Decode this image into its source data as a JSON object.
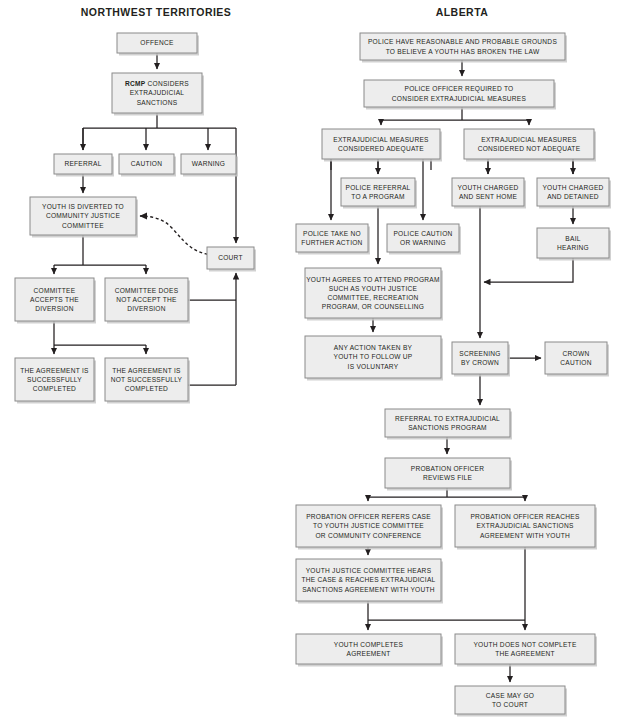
{
  "diagram": {
    "title_left": "NORTHWEST TERRITORIES",
    "title_right": "ALBERTA",
    "box_fill": "#ededed",
    "box_stroke": "#8a8a8a",
    "line_color": "#231f20",
    "background": "#ffffff"
  },
  "columns": [
    {
      "id": "nwt",
      "label": "NORTHWEST TERRITORIES",
      "x": 156,
      "y": 16
    },
    {
      "id": "alberta",
      "label": "ALBERTA",
      "x": 462,
      "y": 16
    }
  ],
  "nodes": [
    {
      "id": "nwt_offence",
      "column": "nwt",
      "x": 117,
      "y": 33,
      "w": 80,
      "h": 20,
      "lines": [
        "OFFENCE"
      ]
    },
    {
      "id": "nwt_rcmp",
      "column": "nwt",
      "x": 112,
      "y": 73,
      "w": 90,
      "h": 40,
      "lines": [
        "RCMP CONSIDERS",
        "EXTRAJUDICIAL",
        "SANCTIONS"
      ],
      "bold_prefix": "RCMP"
    },
    {
      "id": "nwt_referral",
      "column": "nwt",
      "x": 54,
      "y": 154,
      "w": 58,
      "h": 20,
      "lines": [
        "REFERRAL"
      ]
    },
    {
      "id": "nwt_caution",
      "column": "nwt",
      "x": 119,
      "y": 154,
      "w": 55,
      "h": 20,
      "lines": [
        "CAUTION"
      ]
    },
    {
      "id": "nwt_warning",
      "column": "nwt",
      "x": 181,
      "y": 154,
      "w": 55,
      "h": 20,
      "lines": [
        "WARNING"
      ]
    },
    {
      "id": "nwt_diverted",
      "column": "nwt",
      "x": 30,
      "y": 197,
      "w": 106,
      "h": 38,
      "lines": [
        "YOUTH IS DIVERTED TO",
        "COMMUNITY JUSTICE",
        "COMMITTEE"
      ]
    },
    {
      "id": "nwt_court",
      "column": "nwt",
      "x": 207,
      "y": 247,
      "w": 47,
      "h": 22,
      "lines": [
        "COURT"
      ]
    },
    {
      "id": "nwt_accepts",
      "column": "nwt",
      "x": 15,
      "y": 278,
      "w": 79,
      "h": 43,
      "lines": [
        "COMMITTEE",
        "ACCEPTS THE",
        "DIVERSION"
      ]
    },
    {
      "id": "nwt_not_accepts",
      "column": "nwt",
      "x": 105,
      "y": 278,
      "w": 83,
      "h": 43,
      "lines": [
        "COMMITTEE DOES",
        "NOT ACCEPT THE",
        "DIVERSION"
      ]
    },
    {
      "id": "nwt_success",
      "column": "nwt",
      "x": 15,
      "y": 358,
      "w": 79,
      "h": 43,
      "lines": [
        "THE AGREEMENT IS",
        "SUCCESSFULLY",
        "COMPLETED"
      ]
    },
    {
      "id": "nwt_not_success",
      "column": "nwt",
      "x": 105,
      "y": 358,
      "w": 83,
      "h": 43,
      "lines": [
        "THE AGREEMENT IS",
        "NOT SUCCESSFULLY",
        "COMPLETED"
      ]
    },
    {
      "id": "ab_grounds",
      "column": "alberta",
      "x": 360,
      "y": 33,
      "w": 205,
      "h": 27,
      "lines": [
        "POLICE HAVE REASONABLE AND PROBABLE GROUNDS",
        "TO BELIEVE A YOUTH HAS BROKEN THE LAW"
      ]
    },
    {
      "id": "ab_consider",
      "column": "alberta",
      "x": 364,
      "y": 80,
      "w": 190,
      "h": 27,
      "lines": [
        "POLICE OFFICER REQUIRED TO",
        "CONSIDER EXTRAJUDICIAL MEASURES"
      ]
    },
    {
      "id": "ab_adequate",
      "column": "alberta",
      "x": 322,
      "y": 129,
      "w": 118,
      "h": 30,
      "lines": [
        "EXTRAJUDICIAL MEASURES",
        "CONSIDERED ADEQUATE"
      ]
    },
    {
      "id": "ab_not_adequate",
      "column": "alberta",
      "x": 464,
      "y": 129,
      "w": 130,
      "h": 30,
      "lines": [
        "EXTRAJUDICIAL MEASURES",
        "CONSIDERED NOT ADEQUATE"
      ]
    },
    {
      "id": "ab_referral_prog",
      "column": "alberta",
      "x": 341,
      "y": 178,
      "w": 74,
      "h": 28,
      "lines": [
        "POLICE REFERRAL",
        "TO A PROGRAM"
      ]
    },
    {
      "id": "ab_sent_home",
      "column": "alberta",
      "x": 452,
      "y": 178,
      "w": 72,
      "h": 28,
      "lines": [
        "YOUTH CHARGED",
        "AND SENT HOME"
      ]
    },
    {
      "id": "ab_detained",
      "column": "alberta",
      "x": 537,
      "y": 178,
      "w": 72,
      "h": 28,
      "lines": [
        "YOUTH CHARGED",
        "AND DETAINED"
      ]
    },
    {
      "id": "ab_no_action",
      "column": "alberta",
      "x": 296,
      "y": 224,
      "w": 72,
      "h": 28,
      "lines": [
        "POLICE TAKE NO",
        "FURTHER ACTION"
      ]
    },
    {
      "id": "ab_caution_warning",
      "column": "alberta",
      "x": 387,
      "y": 224,
      "w": 72,
      "h": 28,
      "lines": [
        "POLICE CAUTION",
        "OR WARNING"
      ]
    },
    {
      "id": "ab_bail",
      "column": "alberta",
      "x": 537,
      "y": 228,
      "w": 72,
      "h": 30,
      "lines": [
        "BAIL",
        "HEARING"
      ]
    },
    {
      "id": "ab_agrees",
      "column": "alberta",
      "x": 305,
      "y": 268,
      "w": 136,
      "h": 50,
      "lines": [
        "YOUTH AGREES TO ATTEND PROGRAM",
        "SUCH AS YOUTH JUSTICE",
        "COMMITTEE, RECREATION",
        "PROGRAM, OR COUNSELLING"
      ]
    },
    {
      "id": "ab_voluntary",
      "column": "alberta",
      "x": 305,
      "y": 336,
      "w": 136,
      "h": 42,
      "lines": [
        "ANY ACTION TAKEN BY",
        "YOUTH TO FOLLOW UP",
        "IS VOLUNTARY"
      ]
    },
    {
      "id": "ab_screening",
      "column": "alberta",
      "x": 452,
      "y": 342,
      "w": 56,
      "h": 32,
      "lines": [
        "SCREENING",
        "BY CROWN"
      ]
    },
    {
      "id": "ab_crown_caution",
      "column": "alberta",
      "x": 545,
      "y": 342,
      "w": 62,
      "h": 32,
      "lines": [
        "CROWN",
        "CAUTION"
      ]
    },
    {
      "id": "ab_refer_sanctions",
      "column": "alberta",
      "x": 385,
      "y": 409,
      "w": 125,
      "h": 28,
      "lines": [
        "REFERRAL TO EXTRAJUDICIAL",
        "SANCTIONS PROGRAM"
      ]
    },
    {
      "id": "ab_probation_rev",
      "column": "alberta",
      "x": 385,
      "y": 458,
      "w": 125,
      "h": 30,
      "lines": [
        "PROBATION OFFICER",
        "REVIEWS FILE"
      ]
    },
    {
      "id": "ab_po_refers",
      "column": "alberta",
      "x": 296,
      "y": 505,
      "w": 145,
      "h": 42,
      "lines": [
        "PROBATION OFFICER REFERS CASE",
        "TO YOUTH JUSTICE COMMITTEE",
        "OR COMMUNITY CONFERENCE"
      ]
    },
    {
      "id": "ab_po_reaches",
      "column": "alberta",
      "x": 455,
      "y": 505,
      "w": 140,
      "h": 42,
      "lines": [
        "PROBATION OFFICER REACHES",
        "EXTRAJUDICIAL SANCTIONS",
        "AGREEMENT WITH YOUTH"
      ]
    },
    {
      "id": "ab_yjc_hears",
      "column": "alberta",
      "x": 296,
      "y": 559,
      "w": 145,
      "h": 42,
      "lines": [
        "YOUTH JUSTICE COMMITTEE HEARS",
        "THE CASE & REACHES EXTRAJUDICIAL",
        "SANCTIONS AGREEMENT WITH YOUTH"
      ]
    },
    {
      "id": "ab_completes",
      "column": "alberta",
      "x": 296,
      "y": 634,
      "w": 145,
      "h": 30,
      "lines": [
        "YOUTH COMPLETES",
        "AGREEMENT"
      ]
    },
    {
      "id": "ab_not_completes",
      "column": "alberta",
      "x": 455,
      "y": 634,
      "w": 140,
      "h": 30,
      "lines": [
        "YOUTH DOES NOT COMPLETE",
        "THE AGREEMENT"
      ]
    },
    {
      "id": "ab_may_go_court",
      "column": "alberta",
      "x": 455,
      "y": 686,
      "w": 110,
      "h": 28,
      "lines": [
        "CASE MAY GO",
        "TO COURT"
      ]
    }
  ],
  "edges": [
    {
      "id": "e_offence_rcmp",
      "d": "M157,53 L157,69",
      "arrow": true
    },
    {
      "id": "e_rcmp_split",
      "d": "M157,113 L157,128 M83,128 L236,128 M83,128 L83,150",
      "arrow": false
    },
    {
      "id": "e_to_referral",
      "d": "M83,128 L83,150",
      "arrow": true
    },
    {
      "id": "e_to_caution",
      "d": "M146,128 L146,150",
      "arrow": true
    },
    {
      "id": "e_to_warning",
      "d": "M208,128 L208,150",
      "arrow": true
    },
    {
      "id": "e_to_court_top",
      "d": "M236,128 L236,243",
      "arrow": true
    },
    {
      "id": "e_referral_diverted",
      "d": "M83,174 L83,193",
      "arrow": true
    },
    {
      "id": "e_diverted_split",
      "d": "M83,235 L83,265 M54,265 L146,265",
      "arrow": false
    },
    {
      "id": "e_to_accepts",
      "d": "M54,265 L54,274",
      "arrow": true
    },
    {
      "id": "e_to_not_accepts",
      "d": "M146,265 L146,274",
      "arrow": true
    },
    {
      "id": "e_notaccept_court",
      "d": "M188,300 L236,300",
      "arrow": false
    },
    {
      "id": "e_court_up_from_below",
      "d": "M236,385 L236,273",
      "arrow": true
    },
    {
      "id": "e_notsuccess_court",
      "d": "M188,385 L236,385",
      "arrow": false
    },
    {
      "id": "e_accepts_split",
      "d": "M54,321 L54,345 M54,345 L146,345",
      "arrow": false
    },
    {
      "id": "e_to_success",
      "d": "M54,345 L54,354",
      "arrow": true
    },
    {
      "id": "e_to_not_success",
      "d": "M146,345 L146,354",
      "arrow": true
    },
    {
      "id": "e_court_dashed",
      "d": "M230,255 C196,258 188,246 172,228 C163,218 150,216 140,216",
      "arrow": true,
      "dashed": true
    },
    {
      "id": "e_ab_grounds_consider",
      "d": "M462,60 L462,76",
      "arrow": true
    },
    {
      "id": "e_ab_consider_split",
      "d": "M462,107 L462,120 M381,120 L529,120",
      "arrow": false
    },
    {
      "id": "e_ab_to_adequate",
      "d": "M381,120 L381,125",
      "arrow": true
    },
    {
      "id": "e_ab_to_notadequate",
      "d": "M529,120 L529,125",
      "arrow": true
    },
    {
      "id": "e_ab_adeq_split",
      "d": "M331,159 L331,170 M378,159 L378,174 M431,159 L431,170",
      "arrow": false
    },
    {
      "id": "e_ab_to_referralprog",
      "d": "M378,159 L378,174",
      "arrow": true
    },
    {
      "id": "e_ab_to_noaction",
      "d": "M331,159 L331,220",
      "arrow": true
    },
    {
      "id": "e_ab_to_cautionwarn",
      "d": "M423,159 L423,220",
      "arrow": true
    },
    {
      "id": "e_ab_refprog_agrees",
      "d": "M378,206 L378,264",
      "arrow": true
    },
    {
      "id": "e_ab_agrees_vol",
      "d": "M373,318 L373,332",
      "arrow": true
    },
    {
      "id": "e_ab_notadeq_split",
      "d": "M488,159 L488,174 M573,159 L573,174",
      "arrow": false
    },
    {
      "id": "e_ab_to_senthome",
      "d": "M488,159 L488,174",
      "arrow": true
    },
    {
      "id": "e_ab_to_detained",
      "d": "M573,159 L573,174",
      "arrow": true
    },
    {
      "id": "e_ab_detained_bail",
      "d": "M573,206 L573,224",
      "arrow": true
    },
    {
      "id": "e_ab_bail_join",
      "d": "M573,258 L573,282 L484,282",
      "arrow": true
    },
    {
      "id": "e_ab_senthome_down",
      "d": "M480,206 L480,338",
      "arrow": true
    },
    {
      "id": "e_ab_screen_crown",
      "d": "M508,358 L541,358",
      "arrow": true
    },
    {
      "id": "e_ab_screen_referral",
      "d": "M480,374 L480,405",
      "arrow": true
    },
    {
      "id": "e_ab_ref_probation",
      "d": "M447,437 L447,454",
      "arrow": true
    },
    {
      "id": "e_ab_prob_split",
      "d": "M447,488 L447,497 M368,497 L525,497",
      "arrow": false
    },
    {
      "id": "e_ab_to_porefers",
      "d": "M368,497 L368,501",
      "arrow": true
    },
    {
      "id": "e_ab_to_poreaches",
      "d": "M525,497 L525,501",
      "arrow": true
    },
    {
      "id": "e_ab_porefers_yjc",
      "d": "M368,547 L368,555",
      "arrow": true
    },
    {
      "id": "e_ab_yjc_split",
      "d": "M368,601 L368,620 M368,620 L525,620",
      "arrow": false
    },
    {
      "id": "e_ab_to_completes",
      "d": "M368,620 L368,630",
      "arrow": true
    },
    {
      "id": "e_ab_poreaches_down",
      "d": "M525,547 L525,630",
      "arrow": true
    },
    {
      "id": "e_ab_notcomp_court",
      "d": "M510,664 L510,682",
      "arrow": true
    }
  ]
}
